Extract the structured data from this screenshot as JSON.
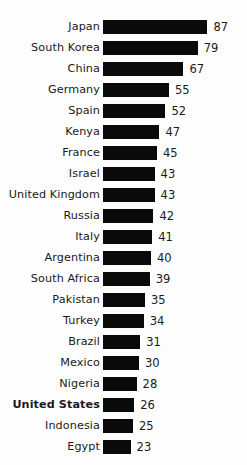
{
  "chart_data": {
    "type": "bar",
    "orientation": "horizontal",
    "title": "",
    "subtitle": "",
    "xlabel": "",
    "ylabel": "",
    "grid": false,
    "legend": false,
    "xlim": [
      0,
      87
    ],
    "categories": [
      "Japan",
      "South Korea",
      "China",
      "Germany",
      "Spain",
      "Kenya",
      "France",
      "Israel",
      "United Kingdom",
      "Russia",
      "Italy",
      "Argentina",
      "South Africa",
      "Pakistan",
      "Turkey",
      "Brazil",
      "Mexico",
      "Nigeria",
      "United States",
      "Indonesia",
      "Egypt"
    ],
    "values": [
      87,
      79,
      67,
      55,
      52,
      47,
      45,
      43,
      43,
      42,
      41,
      40,
      39,
      35,
      34,
      31,
      30,
      28,
      26,
      25,
      23
    ],
    "highlighted_categories": [
      "United States"
    ],
    "bar_color": "#0a0a0a",
    "background_color": "#fdfdfd",
    "text_color": "#1a1a1a"
  },
  "rows": [
    {
      "label": "Japan",
      "value": "87",
      "bold": false
    },
    {
      "label": "South Korea",
      "value": "79",
      "bold": false
    },
    {
      "label": "China",
      "value": "67",
      "bold": false
    },
    {
      "label": "Germany",
      "value": "55",
      "bold": false
    },
    {
      "label": "Spain",
      "value": "52",
      "bold": false
    },
    {
      "label": "Kenya",
      "value": "47",
      "bold": false
    },
    {
      "label": "France",
      "value": "45",
      "bold": false
    },
    {
      "label": "Israel",
      "value": "43",
      "bold": false
    },
    {
      "label": "United Kingdom",
      "value": "43",
      "bold": false
    },
    {
      "label": "Russia",
      "value": "42",
      "bold": false
    },
    {
      "label": "Italy",
      "value": "41",
      "bold": false
    },
    {
      "label": "Argentina",
      "value": "40",
      "bold": false
    },
    {
      "label": "South Africa",
      "value": "39",
      "bold": false
    },
    {
      "label": "Pakistan",
      "value": "35",
      "bold": false
    },
    {
      "label": "Turkey",
      "value": "34",
      "bold": false
    },
    {
      "label": "Brazil",
      "value": "31",
      "bold": false
    },
    {
      "label": "Mexico",
      "value": "30",
      "bold": false
    },
    {
      "label": "Nigeria",
      "value": "28",
      "bold": false
    },
    {
      "label": "United States",
      "value": "26",
      "bold": true
    },
    {
      "label": "Indonesia",
      "value": "25",
      "bold": false
    },
    {
      "label": "Egypt",
      "value": "23",
      "bold": false
    }
  ],
  "scale": {
    "px_per_unit": 1.2
  }
}
